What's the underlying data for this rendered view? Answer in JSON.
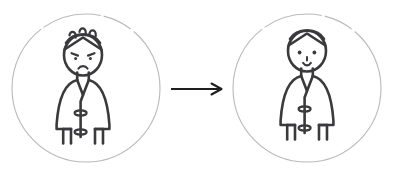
{
  "page": {
    "background_color": "#ffffff",
    "clipped_header_text": "              ",
    "width": 394,
    "height": 176
  },
  "colors": {
    "figure_stroke": "#3a3a3c",
    "circle_stroke": "#b9b9bf",
    "arrow_stroke": "#1e1e1e",
    "background": "#ffffff"
  },
  "illustration": {
    "type": "before-after-transformation",
    "panels": [
      {
        "id": "before",
        "role": "before-state",
        "label": "Stressed patient in hospital gown",
        "circle": {
          "cx": 86,
          "cy": 88,
          "r": 74
        },
        "figure": {
          "emotion": "sad",
          "emotion_label": "sad-face",
          "mouth": "frown",
          "eyes": "downturned",
          "has_stress_marks": true,
          "stress_mark_count": 3,
          "garment": "hospital-gown"
        }
      },
      {
        "id": "after",
        "role": "after-state",
        "label": "Happy patient in hospital gown",
        "circle": {
          "cx": 307,
          "cy": 88,
          "r": 74
        },
        "figure": {
          "emotion": "happy",
          "emotion_label": "happy-face",
          "mouth": "smile",
          "eyes": "round-dots",
          "has_stress_marks": false,
          "stress_mark_count": 0,
          "garment": "hospital-gown"
        }
      }
    ],
    "connector": {
      "type": "arrow",
      "direction": "right",
      "x1": 171,
      "x2": 222,
      "y": 89
    }
  }
}
